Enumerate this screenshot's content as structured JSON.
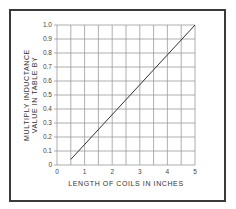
{
  "chart_data": {
    "type": "line",
    "title": "",
    "xlabel": "LENGTH OF COILS IN INCHES",
    "ylabel": [
      "MULTIPLY INDUCTANCE",
      "VALUE IN TABLE BY"
    ],
    "xlim": [
      0,
      5
    ],
    "ylim": [
      0,
      1.0
    ],
    "x_ticks": [
      "0",
      "1",
      "2",
      "3",
      "4",
      "5"
    ],
    "y_ticks": [
      "0",
      "0.1",
      "0.2",
      "0.3",
      "0.4",
      "0.5",
      "0.6",
      "0.7",
      "0.8",
      "0.9",
      "1.0"
    ],
    "grid": true,
    "grid_x_step": 0.5,
    "grid_y_step": 0.1,
    "legend": null,
    "series": [
      {
        "name": "Inductance multiplier",
        "x": [
          0.5,
          5.0
        ],
        "y": [
          0.04,
          1.0
        ]
      }
    ]
  },
  "colors": {
    "frame": "#3a3a3a",
    "grid": "#9a9a9a",
    "line": "#333333",
    "text": "#444444"
  }
}
